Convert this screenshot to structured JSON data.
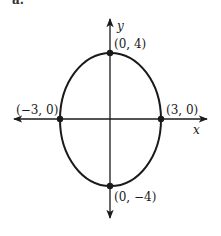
{
  "figure": {
    "partial_label": "a.",
    "axes": {
      "x_label": "x",
      "y_label": "y",
      "origin_px": [
        110,
        119
      ],
      "x_axis_px": [
        14,
        207
      ],
      "y_axis_px": [
        19,
        218
      ]
    },
    "ellipse": {
      "equation_semi_axes": {
        "a": 3,
        "b": 4
      },
      "center_px": [
        110.5,
        119.5
      ],
      "rx_px": 50.5,
      "ry_px": 66.5,
      "stroke": "#1a1a1a"
    },
    "points": [
      {
        "label": "(0, 4)",
        "coords": [
          0,
          4
        ],
        "px": [
          110,
          53
        ]
      },
      {
        "label": "(−3, 0)",
        "coords": [
          -3,
          0
        ],
        "px": [
          60,
          119
        ]
      },
      {
        "label": "(3, 0)",
        "coords": [
          3,
          0
        ],
        "px": [
          161,
          119
        ]
      },
      {
        "label": "(0, −4)",
        "coords": [
          0,
          -4
        ],
        "px": [
          110,
          186
        ]
      }
    ]
  }
}
